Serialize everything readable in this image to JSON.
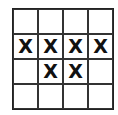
{
  "grid": {
    "rows": 4,
    "cols": 4,
    "cells": [
      [
        "",
        "",
        "",
        ""
      ],
      [
        "X",
        "X",
        "X",
        "X"
      ],
      [
        "",
        "X",
        "X",
        ""
      ],
      [
        "",
        "",
        "",
        ""
      ]
    ]
  }
}
